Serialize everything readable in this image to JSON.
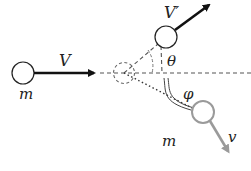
{
  "diagram": {
    "type": "elastic collision (2D scattering)",
    "labels": {
      "incoming_velocity": "V",
      "incoming_mass": "m",
      "outgoing_velocity_projectile": "V′",
      "angle_projectile": "θ",
      "angle_target": "φ",
      "target_mass": "m",
      "target_velocity": "v"
    },
    "colors": {
      "ink": "#1a1a1a",
      "dashed": "#555555",
      "target": "#999999",
      "background": "#ffffff"
    }
  }
}
